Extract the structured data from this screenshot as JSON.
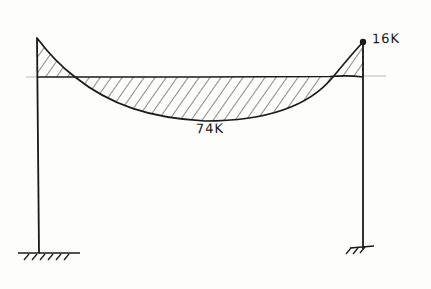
{
  "diagram": {
    "type": "bending-moment-diagram",
    "structure": "portal-frame",
    "supports": {
      "left": "fixed",
      "right": "fixed"
    },
    "labels": {
      "midspan_moment": "74K",
      "right_end_moment": "16K"
    },
    "colors": {
      "ink": "#1a1a1a",
      "paper": "#fdfdfc",
      "faint_guide": "#bbbbbb"
    }
  }
}
